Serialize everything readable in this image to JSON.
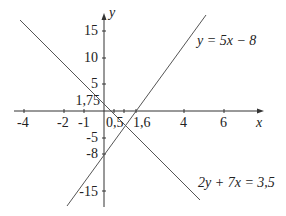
{
  "diagram": {
    "title": "",
    "axes": {
      "x_label": "x",
      "y_label": "y",
      "x_ticks": [
        "-4",
        "-2",
        "-1",
        "0,5",
        "1,6",
        "4",
        "6"
      ],
      "y_ticks": [
        "15",
        "10",
        "5",
        "1,75",
        "-5",
        "-8",
        "-15"
      ]
    },
    "lines": [
      {
        "name": "line-y-equals-5x-minus-8",
        "equation": "y = 5x − 8",
        "slope": 5,
        "intercept": -8,
        "x_intercept": "1,6"
      },
      {
        "name": "line-2y-plus-7x-equals-3-5",
        "equation": "2y + 7x = 3,5",
        "slope": -3.5,
        "intercept": 1.75,
        "x_intercept": "0,5"
      }
    ],
    "labels": {
      "eq1": "y = 5x − 8",
      "eq2": "2y + 7x = 3,5",
      "x_axis": "x",
      "y_axis": "y",
      "xt_m4": "-4",
      "xt_m2": "-2",
      "xt_m1": "-1",
      "xt_05": "0,5",
      "xt_16": "1,6",
      "xt_4": "4",
      "xt_6": "6",
      "yt_15": "15",
      "yt_10": "10",
      "yt_5": "5",
      "yt_175": "1,75",
      "yt_m5": "-5",
      "yt_m8": "-8",
      "yt_m15": "-15"
    },
    "colors": {
      "line": "#555555",
      "axis": "#333333",
      "text": "#222222"
    }
  }
}
